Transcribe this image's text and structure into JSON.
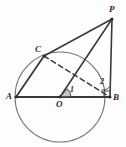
{
  "figure": {
    "background_color": "#fefefe",
    "stroke_color": "#3a3a3a",
    "circle_color": "#7a7a7a",
    "label_color": "#2b2b2b",
    "width": 126,
    "height": 147
  },
  "circle": {
    "name": "circle-O",
    "cx": 60,
    "cy": 97,
    "r": 45
  },
  "points": [
    {
      "id": "A",
      "label": "A",
      "x": 16,
      "y": 97,
      "label_x": 6,
      "label_y": 92,
      "dot": true
    },
    {
      "id": "B",
      "label": "B",
      "x": 110,
      "y": 97,
      "label_x": 113,
      "label_y": 93,
      "dot": true
    },
    {
      "id": "C",
      "label": "C",
      "x": 44,
      "y": 56,
      "label_x": 35,
      "label_y": 45,
      "dot": true
    },
    {
      "id": "O",
      "label": "O",
      "x": 60,
      "y": 97,
      "label_x": 56,
      "label_y": 100,
      "dot": true
    },
    {
      "id": "P",
      "label": "P",
      "x": 112,
      "y": 19,
      "label_x": 109,
      "label_y": 5,
      "dot": true
    }
  ],
  "segments": [
    {
      "name": "segment-AB",
      "from": "A",
      "to": "B",
      "style": "solid",
      "x1": 16,
      "y1": 97,
      "x2": 110,
      "y2": 97
    },
    {
      "name": "segment-AC",
      "from": "A",
      "to": "C",
      "style": "solid",
      "x1": 16,
      "y1": 97,
      "x2": 44,
      "y2": 56
    },
    {
      "name": "segment-CP",
      "from": "C",
      "to": "P",
      "style": "solid",
      "x1": 44,
      "y1": 56,
      "x2": 112,
      "y2": 19
    },
    {
      "name": "segment-BP",
      "from": "B",
      "to": "P",
      "style": "solid",
      "x1": 110,
      "y1": 97,
      "x2": 112,
      "y2": 19
    },
    {
      "name": "segment-OP",
      "from": "O",
      "to": "P",
      "style": "solid",
      "x1": 60,
      "y1": 97,
      "x2": 112,
      "y2": 19
    },
    {
      "name": "segment-CB",
      "from": "C",
      "to": "B",
      "style": "dashed",
      "x1": 44,
      "y1": 56,
      "x2": 110,
      "y2": 97
    }
  ],
  "angles": [
    {
      "name": "angle-1-at-O",
      "label": "1",
      "vertex": "O",
      "label_x": 70,
      "label_y": 86,
      "arc_r": 11,
      "filled": true
    },
    {
      "name": "angle-2-at-B",
      "label": "2",
      "vertex": "B",
      "label_x": 100,
      "label_y": 78,
      "arc_r": 11,
      "filled": false
    }
  ],
  "right_angle_marker": {
    "name": "right-angle-marker-at-B",
    "vertex": "B",
    "size": 6
  }
}
